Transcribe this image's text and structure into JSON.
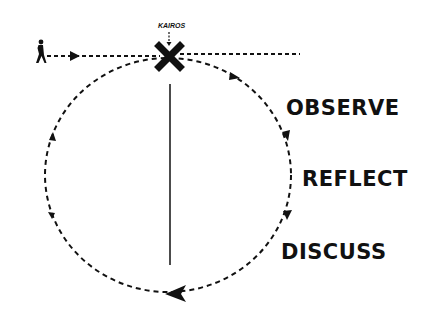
{
  "diagram": {
    "marker_label": "KAIROS",
    "stages": [
      {
        "label": "OBSERVE"
      },
      {
        "label": "REFLECT"
      },
      {
        "label": "DISCUSS"
      }
    ],
    "icons": [
      "walking-person-icon",
      "x-marker-icon"
    ],
    "colors": {
      "stroke": "#111111",
      "background": "#ffffff"
    }
  }
}
